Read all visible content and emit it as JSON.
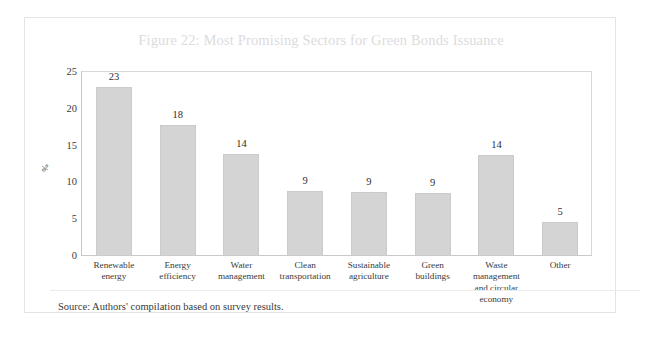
{
  "figure": {
    "title": "Figure 22: Most Promising Sectors for Green Bonds Issuance",
    "source_note": "Source: Authors' compilation based on survey results.",
    "title_color": "#dcdcdc",
    "bar_color": "#d4d4d4",
    "frame_color": "#e3e3e3"
  },
  "chart_data": {
    "type": "bar",
    "title": "Figure 22: Most Promising Sectors for Green Bonds Issuance",
    "xlabel": "",
    "ylabel": "%",
    "ylim": [
      0,
      25
    ],
    "yticks": [
      0,
      5,
      10,
      15,
      20,
      25
    ],
    "ytick_labels": [
      "0",
      "5",
      "10",
      "15",
      "20",
      "25"
    ],
    "grid": false,
    "legend": "none",
    "categories": [
      "Renewable energy",
      "Energy efficiency",
      "Water management",
      "Clean transportation",
      "Sustainable agriculture",
      "Green buildings",
      "Waste management and circular economy",
      "Other"
    ],
    "category_lines": [
      [
        "Renewable",
        "energy"
      ],
      [
        "Energy",
        "efficiency"
      ],
      [
        "Water",
        "management"
      ],
      [
        "Clean",
        "transportation"
      ],
      [
        "Sustainable",
        "agriculture"
      ],
      [
        "Green",
        "buildings"
      ],
      [
        "Waste",
        "management",
        "and circular",
        "economy"
      ],
      [
        "Other"
      ]
    ],
    "values": [
      23,
      17.8,
      13.9,
      8.8,
      8.7,
      8.6,
      13.7,
      4.6
    ],
    "data_labels": [
      "23",
      "18",
      "14",
      "9",
      "9",
      "9",
      "14",
      "5"
    ]
  }
}
